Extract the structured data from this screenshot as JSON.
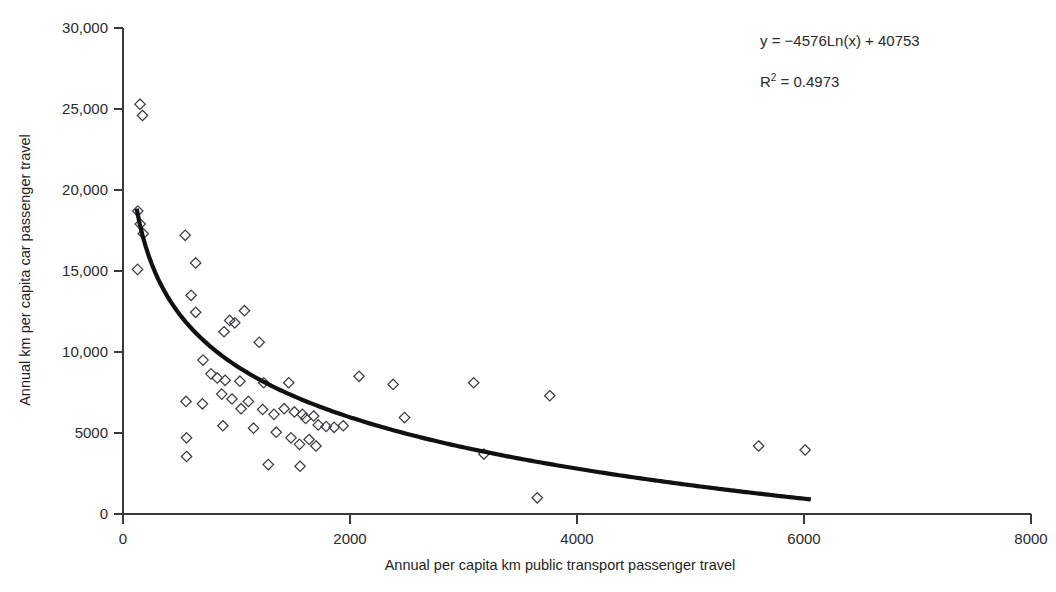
{
  "chart_data": {
    "type": "scatter",
    "title": "",
    "xlabel": "Annual per capita km public transport passenger travel",
    "ylabel": "Annual km per capita car passenger travel",
    "xlim": [
      0,
      8000
    ],
    "ylim": [
      0,
      30000
    ],
    "grid": false,
    "legend": null,
    "xticks": [
      0,
      2000,
      4000,
      6000,
      8000
    ],
    "xticklabels": [
      "0",
      "2000",
      "4000",
      "6000",
      "8000"
    ],
    "yticks": [
      0,
      5000,
      10000,
      15000,
      20000,
      25000,
      30000
    ],
    "yticklabels": [
      "0",
      "5000",
      "10,000",
      "15,000",
      "20,000",
      "25,000",
      "30,000"
    ],
    "marker": "diamond-open",
    "annotations": [
      {
        "id": "equation",
        "text": "y = −4576Ln(x) + 40753",
        "x": 4950,
        "y": 28300
      },
      {
        "id": "r-squared",
        "text": "R",
        "sup": "2",
        "text_tail": " = 0.4973",
        "x": 4950,
        "y": 26200
      }
    ],
    "fit": {
      "kind": "logarithmic",
      "equation": "y = -4576*Ln(x) + 40753",
      "slope": -4576,
      "intercept": 40753,
      "r_squared": 0.4973,
      "x_start": 120,
      "x_end": 6060
    },
    "points": [
      [
        150,
        25300
      ],
      [
        172,
        24600
      ],
      [
        130,
        18700
      ],
      [
        152,
        17900
      ],
      [
        178,
        17300
      ],
      [
        128,
        15100
      ],
      [
        548,
        17200
      ],
      [
        640,
        15500
      ],
      [
        600,
        13500
      ],
      [
        640,
        12450
      ],
      [
        1070,
        12550
      ],
      [
        940,
        11950
      ],
      [
        985,
        11800
      ],
      [
        890,
        11250
      ],
      [
        1200,
        10600
      ],
      [
        705,
        9500
      ],
      [
        775,
        8650
      ],
      [
        830,
        8400
      ],
      [
        900,
        8250
      ],
      [
        1030,
        8200
      ],
      [
        1240,
        8100
      ],
      [
        1460,
        8100
      ],
      [
        2080,
        8500
      ],
      [
        2380,
        8000
      ],
      [
        3090,
        8100
      ],
      [
        3760,
        7300
      ],
      [
        555,
        6950
      ],
      [
        700,
        6800
      ],
      [
        870,
        7400
      ],
      [
        960,
        7100
      ],
      [
        1040,
        6500
      ],
      [
        1105,
        6950
      ],
      [
        1230,
        6450
      ],
      [
        1330,
        6150
      ],
      [
        1420,
        6500
      ],
      [
        1510,
        6300
      ],
      [
        1580,
        6150
      ],
      [
        1610,
        5900
      ],
      [
        1680,
        6050
      ],
      [
        1720,
        5500
      ],
      [
        1790,
        5400
      ],
      [
        1860,
        5350
      ],
      [
        1940,
        5450
      ],
      [
        2480,
        5950
      ],
      [
        880,
        5450
      ],
      [
        1150,
        5300
      ],
      [
        1350,
        5050
      ],
      [
        1480,
        4700
      ],
      [
        1555,
        4300
      ],
      [
        1640,
        4600
      ],
      [
        1700,
        4200
      ],
      [
        560,
        4700
      ],
      [
        560,
        3550
      ],
      [
        1280,
        3050
      ],
      [
        1560,
        2950
      ],
      [
        3180,
        3700
      ],
      [
        5600,
        4200
      ],
      [
        6010,
        3950
      ],
      [
        3650,
        1000
      ]
    ]
  },
  "axis": {
    "y_title": "Annual km per capita car passenger travel",
    "x_title": "Annual per capita km public transport passenger travel"
  }
}
